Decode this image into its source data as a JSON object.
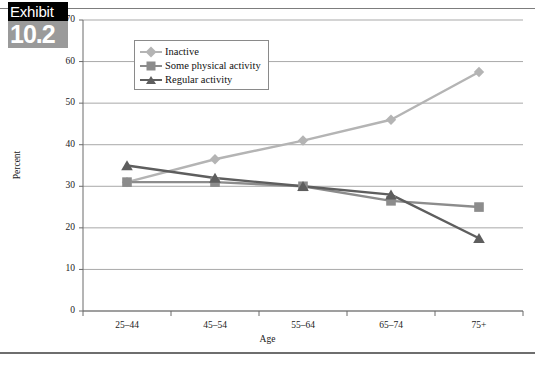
{
  "exhibit": {
    "word": "Exhibit",
    "number": "10.2"
  },
  "chart_data": {
    "type": "line",
    "title": "",
    "xlabel": "Age",
    "ylabel": "Percent",
    "categories": [
      "25–44",
      "45–54",
      "55–64",
      "65–74",
      "75+"
    ],
    "ylim": [
      0,
      70
    ],
    "yticks": [
      "0",
      "10",
      "20",
      "30",
      "40",
      "50",
      "60",
      "70"
    ],
    "grid": "horizontal",
    "legend_position": "top-left-inside",
    "series": [
      {
        "name": "Inactive",
        "marker": "diamond",
        "color": "#b4b4b4",
        "values": [
          31,
          36.5,
          41,
          46,
          57.5
        ]
      },
      {
        "name": "Some physical activity",
        "marker": "square",
        "color": "#8c8c8c",
        "values": [
          31,
          31,
          30,
          26.5,
          25
        ]
      },
      {
        "name": "Regular activity",
        "marker": "triangle",
        "color": "#5e5e5e",
        "values": [
          35,
          32,
          30,
          28,
          17.5
        ]
      }
    ]
  }
}
